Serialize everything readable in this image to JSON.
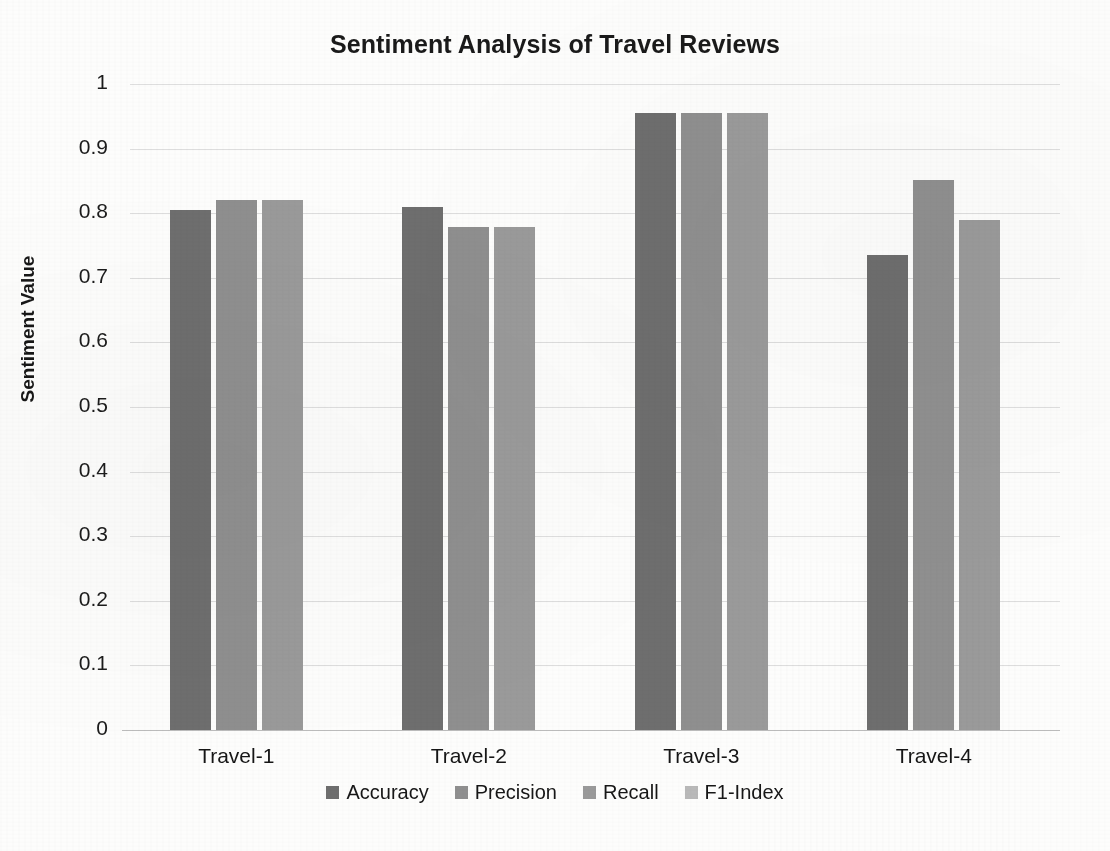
{
  "chart_data": {
    "type": "bar",
    "title": "Sentiment Analysis of Travel Reviews",
    "xlabel": "",
    "ylabel": "Sentiment Value",
    "ylim": [
      0,
      1
    ],
    "ytick_labels": [
      "1",
      "0.9",
      "0.8",
      "0.7",
      "0.6",
      "0.5",
      "0.4",
      "0.3",
      "0.2",
      "0.1",
      "0"
    ],
    "ytick_values": [
      1,
      0.9,
      0.8,
      0.7,
      0.6,
      0.5,
      0.4,
      0.3,
      0.2,
      0.1,
      0
    ],
    "grid": true,
    "legend_position": "bottom",
    "categories": [
      "Travel-1",
      "Travel-2",
      "Travel-3",
      "Travel-4"
    ],
    "series": [
      {
        "name": "Accuracy",
        "color": "#6e6e6e",
        "values": [
          0.805,
          0.81,
          0.955,
          0.735
        ]
      },
      {
        "name": "Precision",
        "color": "#8f8f8f",
        "values": [
          0.82,
          0.778,
          0.955,
          0.852
        ]
      },
      {
        "name": "Recall",
        "color": "#9a9a9a",
        "values": [
          0.82,
          0.778,
          0.955,
          0.79
        ]
      },
      {
        "name": "F1-Index",
        "color": "#b9b9b9",
        "values": [
          null,
          null,
          null,
          null
        ]
      }
    ],
    "bars_rendered_per_group": 3
  },
  "legend": {
    "items": [
      {
        "label": "Accuracy",
        "color": "#6e6e6e"
      },
      {
        "label": "Precision",
        "color": "#8f8f8f"
      },
      {
        "label": "Recall",
        "color": "#9a9a9a"
      },
      {
        "label": "F1-Index",
        "color": "#b9b9b9"
      }
    ]
  }
}
